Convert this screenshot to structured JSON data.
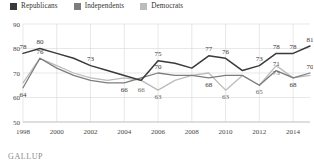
{
  "legend": {
    "items": [
      {
        "label": "Republicans",
        "color": "#3a3a3a"
      },
      {
        "label": "Independents",
        "color": "#7d7d7d"
      },
      {
        "label": "Democrats",
        "color": "#bcbcbc"
      }
    ]
  },
  "source": {
    "label": "GALLUP"
  },
  "chart_data": {
    "type": "line",
    "title": "",
    "subtitle": "",
    "xlabel": "",
    "ylabel": "",
    "ylim": [
      50,
      90
    ],
    "yticks": [
      50,
      60,
      70,
      80,
      90
    ],
    "xlim": [
      1998,
      2015
    ],
    "xticks": [
      1998,
      2000,
      2002,
      2004,
      2006,
      2008,
      2010,
      2012,
      2014
    ],
    "xtick_labels": [
      "1998",
      "2000",
      "2002",
      "2004",
      "2006",
      "2008",
      "2010",
      "2012",
      "2014"
    ],
    "grid": true,
    "legend_position": "top-left",
    "x": [
      1998,
      1999,
      2000,
      2001,
      2002,
      2003,
      2004,
      2005,
      2006,
      2007,
      2008,
      2009,
      2010,
      2011,
      2012,
      2013,
      2014,
      2015
    ],
    "series": [
      {
        "name": "Republicans",
        "color": "#3a3a3a",
        "values": [
          78,
          80,
          78,
          76,
          73,
          71,
          69,
          67,
          75,
          74,
          72,
          77,
          76,
          71,
          73,
          78,
          78,
          81
        ],
        "labels": [
          {
            "x": 1998,
            "y": 78,
            "text": "78"
          },
          {
            "x": 1999,
            "y": 80,
            "text": "80"
          },
          {
            "x": 2002,
            "y": 73,
            "text": "73"
          },
          {
            "x": 2006,
            "y": 75,
            "text": "75"
          },
          {
            "x": 2009,
            "y": 77,
            "text": "77"
          },
          {
            "x": 2010,
            "y": 76,
            "text": "76"
          },
          {
            "x": 2012,
            "y": 73,
            "text": "73"
          },
          {
            "x": 2013,
            "y": 78,
            "text": "78"
          },
          {
            "x": 2014,
            "y": 78,
            "text": "78"
          },
          {
            "x": 2015,
            "y": 81,
            "text": "81"
          }
        ]
      },
      {
        "name": "Independents",
        "color": "#7d7d7d",
        "values": [
          64,
          76,
          72,
          69,
          67,
          66,
          66,
          68,
          70,
          69,
          69,
          68,
          69,
          69,
          65,
          71,
          68,
          70
        ],
        "labels": [
          {
            "x": 1998,
            "y": 64,
            "text": "64"
          },
          {
            "x": 1999,
            "y": 76,
            "text": "76"
          },
          {
            "x": 2004,
            "y": 66,
            "text": "66"
          },
          {
            "x": 2006,
            "y": 70,
            "text": "70"
          },
          {
            "x": 2009,
            "y": 68,
            "text": "68"
          },
          {
            "x": 2013,
            "y": 71,
            "text": "71"
          },
          {
            "x": 2014,
            "y": 68,
            "text": "68"
          },
          {
            "x": 2015,
            "y": 70,
            "text": "70"
          }
        ]
      },
      {
        "name": "Democrats",
        "color": "#bcbcbc",
        "values": [
          66,
          76,
          73,
          70,
          68,
          67,
          68,
          67,
          63,
          67,
          69,
          70,
          63,
          69,
          65,
          73,
          68,
          69
        ],
        "labels": [
          {
            "x": 2005,
            "y": 66,
            "text": "66"
          },
          {
            "x": 2006,
            "y": 63,
            "text": "63"
          },
          {
            "x": 2010,
            "y": 63,
            "text": "63"
          },
          {
            "x": 2012,
            "y": 65,
            "text": "65"
          },
          {
            "x": 2013,
            "y": 73,
            "text": "73"
          }
        ]
      }
    ]
  }
}
